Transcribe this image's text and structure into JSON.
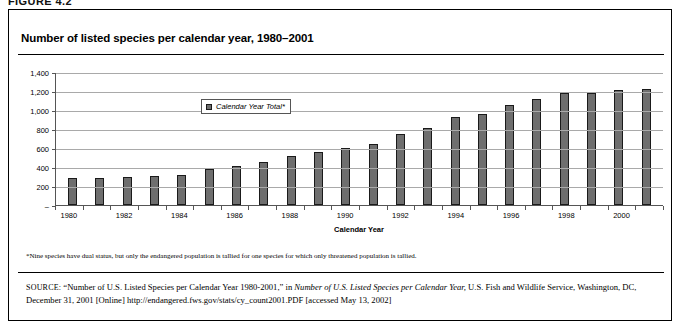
{
  "figure": {
    "caption": "FIGURE 4.2"
  },
  "chart_title": "Number of listed species per calendar year, 1980–2001",
  "legend": {
    "label": "Calendar Year Total*",
    "swatch_color": "#6e6e6e"
  },
  "footnote": "*Nine species have dual status, but only the endangered population is tallied for one species for which only threatened population is tallied.",
  "source": {
    "keyword": "SOURCE:",
    "text_part1": " “Number of U.S. Listed Species per Calendar Year 1980-2001,” in ",
    "italic_title": "Number of U.S. Listed Species per Calendar Year,",
    "text_part2": " U.S. Fish and Wildlife Service, Washington, DC, December 31, 2001 [Online] http://endangered.fws.gov/stats/cy_count2001.PDF [accessed May 13, 2002]"
  },
  "chart_data": {
    "type": "bar",
    "title": "Number of listed species per calendar year, 1980–2001",
    "xlabel": "Calendar Year",
    "ylabel": "",
    "ylim": [
      0,
      1400
    ],
    "ytick_values": [
      1400,
      1200,
      1000,
      800,
      600,
      400,
      200,
      0
    ],
    "ytick_labels": [
      "1,400",
      "1,200",
      "1,000",
      "800",
      "600",
      "400",
      "200",
      "–"
    ],
    "grid": true,
    "legend_position": "inside-top-left",
    "series_name": "Calendar Year Total*",
    "bar_color": "#6e6e6e",
    "categories": [
      1980,
      1981,
      1982,
      1983,
      1984,
      1985,
      1986,
      1987,
      1988,
      1989,
      1990,
      1991,
      1992,
      1993,
      1994,
      1995,
      1996,
      1997,
      1998,
      1999,
      2000,
      2001
    ],
    "xtick_labels": [
      "1980",
      "1982",
      "1984",
      "1986",
      "1988",
      "1990",
      "1992",
      "1994",
      "1996",
      "1998",
      "2000"
    ],
    "values": [
      280,
      282,
      291,
      301,
      318,
      383,
      407,
      452,
      518,
      554,
      595,
      639,
      745,
      811,
      930,
      962,
      1052,
      1118,
      1176,
      1181,
      1209,
      1226
    ]
  }
}
